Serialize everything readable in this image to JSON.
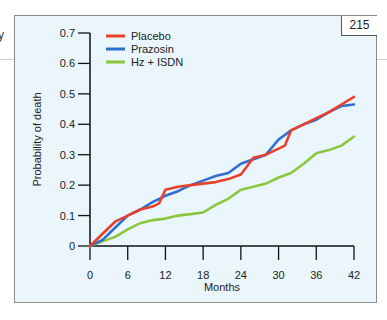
{
  "page_number": "215",
  "stray_text": "y",
  "chart_data": {
    "type": "line",
    "title": "",
    "xlabel": "Months",
    "ylabel": "Probability of death",
    "xlim": [
      0,
      42
    ],
    "ylim": [
      0,
      0.7
    ],
    "x_ticks": [
      "0",
      "6",
      "12",
      "18",
      "24",
      "30",
      "36",
      "42"
    ],
    "y_ticks": [
      "0",
      "0.1",
      "0.2",
      "0.3",
      "0.4",
      "0.5",
      "0.6",
      "0.7"
    ],
    "grid": false,
    "legend_position": "top-left",
    "series": [
      {
        "name": "Placebo",
        "color": "#e8402a",
        "x": [
          0,
          2,
          4,
          6,
          8,
          10,
          11,
          12,
          14,
          16,
          18,
          20,
          22,
          24,
          26,
          28,
          30,
          31,
          32,
          34,
          36,
          38,
          40,
          42
        ],
        "y": [
          0,
          0.04,
          0.08,
          0.1,
          0.12,
          0.13,
          0.14,
          0.185,
          0.195,
          0.2,
          0.205,
          0.21,
          0.22,
          0.235,
          0.29,
          0.3,
          0.32,
          0.33,
          0.38,
          0.4,
          0.42,
          0.44,
          0.465,
          0.49
        ]
      },
      {
        "name": "Prazosin",
        "color": "#2f6fd0",
        "x": [
          0,
          2,
          4,
          6,
          8,
          10,
          12,
          14,
          16,
          18,
          20,
          22,
          24,
          26,
          28,
          30,
          32,
          34,
          36,
          38,
          40,
          42
        ],
        "y": [
          0,
          0.02,
          0.06,
          0.1,
          0.12,
          0.145,
          0.165,
          0.18,
          0.2,
          0.215,
          0.23,
          0.24,
          0.27,
          0.285,
          0.3,
          0.35,
          0.38,
          0.4,
          0.415,
          0.44,
          0.46,
          0.465
        ]
      },
      {
        "name": "Hz + ISDN",
        "color": "#8cc63f",
        "x": [
          0,
          2,
          4,
          6,
          8,
          10,
          12,
          14,
          16,
          18,
          20,
          22,
          24,
          26,
          28,
          30,
          32,
          34,
          36,
          38,
          40,
          42
        ],
        "y": [
          0,
          0.015,
          0.03,
          0.055,
          0.075,
          0.085,
          0.09,
          0.1,
          0.105,
          0.11,
          0.135,
          0.155,
          0.185,
          0.195,
          0.205,
          0.225,
          0.24,
          0.27,
          0.305,
          0.315,
          0.33,
          0.36
        ]
      }
    ]
  }
}
